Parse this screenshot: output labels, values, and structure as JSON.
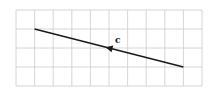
{
  "diagram": {
    "grid": {
      "columns": 10,
      "rows": 4
    },
    "vector": {
      "label": "c",
      "start": {
        "col": 9,
        "row": 3
      },
      "end": {
        "col": 1,
        "row": 1
      },
      "arrow_position": "midpoint",
      "arrow_direction": "up-left"
    },
    "colors": {
      "grid": "#cccccc",
      "line": "#1a1a1a"
    }
  }
}
